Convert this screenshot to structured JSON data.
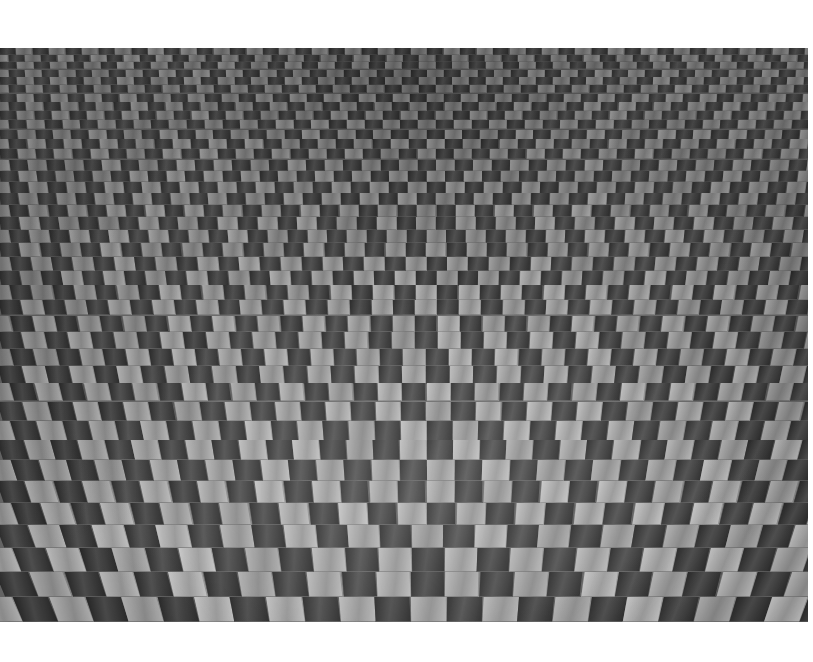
{
  "page": {
    "background_color": "#ffffff",
    "width": 813,
    "height": 662
  },
  "photograph": {
    "title": "Tiled paved surface in perspective",
    "medium": "black-and-white photograph",
    "subject": "checkerboard brick paving",
    "frame": {
      "x": 0,
      "y": 48,
      "width": 808,
      "height": 574
    },
    "margins": {
      "top": 48,
      "right": 5,
      "bottom": 40,
      "left": 0
    },
    "tone": {
      "dark_tile": "#3a3a3a",
      "dark_tile_far": "#4b4b4b",
      "light_tile": "#a8a8a8",
      "light_tile_far": "#8e8e8e",
      "mortar": "#6e6e6e",
      "highlight": "#cfcfcf",
      "shadow": "#262626"
    },
    "perspective": {
      "vanishing_point_x": 440,
      "vanishing_point_y": -210,
      "description": "steep downward view; rows compress toward the top, tiles splay outward from a central vertical axis",
      "near_row_height": 40,
      "far_row_height": 11,
      "row_count": 40,
      "columns_near": 22,
      "columns_far": 62
    }
  }
}
